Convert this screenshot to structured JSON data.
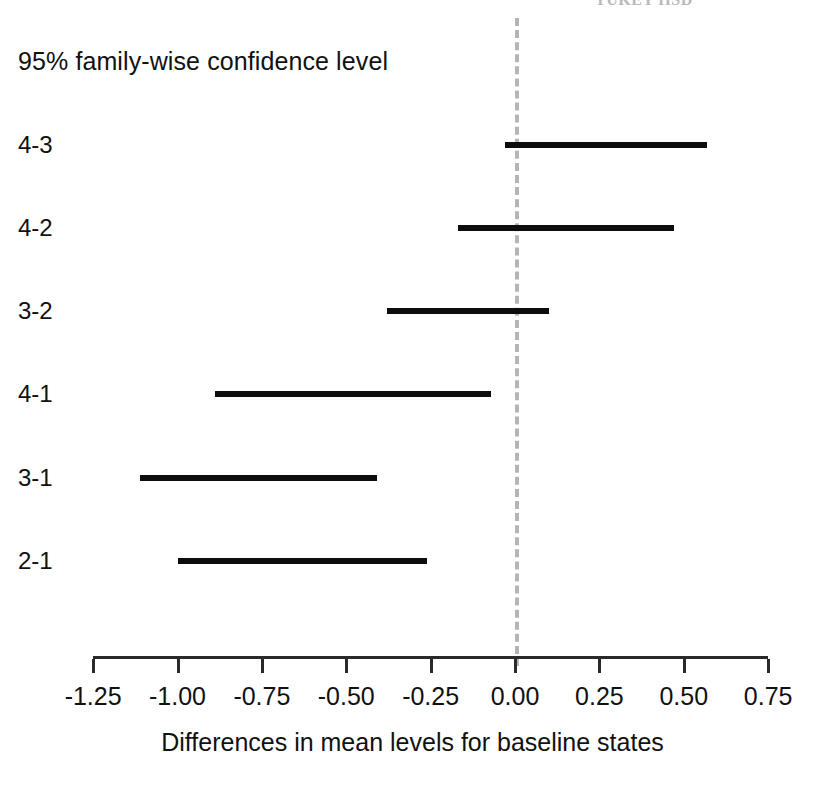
{
  "figure": {
    "clipped_header_text": "TUKEY HSD",
    "confidence_label": "95% family-wise confidence level",
    "xlabel": "Differences in mean levels for baseline states"
  },
  "chart_data": {
    "type": "line",
    "title": "95% family-wise confidence level",
    "xlabel": "Differences in mean levels for baseline states",
    "ylabel": "",
    "xlim": [
      -1.375,
      0.79
    ],
    "ylim": [
      0,
      7
    ],
    "grid": false,
    "legend": "none",
    "reference_line": {
      "value": 0.0,
      "orientation": "vertical",
      "style": "dashed",
      "color": "#b5b5b5"
    },
    "xticks": [
      -1.25,
      -1.0,
      -0.75,
      -0.5,
      -0.25,
      0.0,
      0.25,
      0.5,
      0.75
    ],
    "xticklabels": [
      "-1.25",
      "-1.00",
      "-0.75",
      "-0.50",
      "-0.25",
      "0.00",
      "0.25",
      "0.50",
      "0.75"
    ],
    "categories": [
      "4-3",
      "4-2",
      "3-2",
      "4-1",
      "3-1",
      "2-1"
    ],
    "series": [
      {
        "name": "confidence interval",
        "intervals": [
          {
            "category": "4-3",
            "lower": -0.03,
            "upper": 0.57
          },
          {
            "category": "4-2",
            "lower": -0.17,
            "upper": 0.47
          },
          {
            "category": "3-2",
            "lower": -0.38,
            "upper": 0.1
          },
          {
            "category": "4-1",
            "lower": -0.89,
            "upper": -0.07
          },
          {
            "category": "3-1",
            "lower": -1.11,
            "upper": -0.41
          },
          {
            "category": "2-1",
            "lower": -1.0,
            "upper": -0.26
          }
        ]
      }
    ]
  },
  "colors": {
    "bar": "#0d0d0d",
    "axis": "#2a2a2a",
    "reference": "#b5b5b5",
    "text": "#111111",
    "background": "#ffffff"
  }
}
